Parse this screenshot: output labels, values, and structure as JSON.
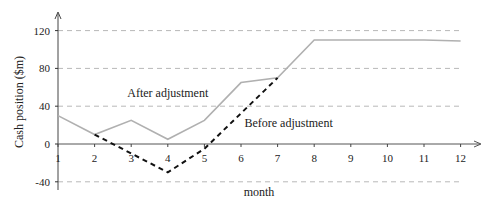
{
  "chart_data": {
    "type": "line",
    "title": "",
    "xlabel": "month",
    "ylabel": "Cash position ($m)",
    "x": [
      1,
      2,
      3,
      4,
      5,
      6,
      7,
      8,
      9,
      10,
      11,
      12
    ],
    "xticks": [
      "1",
      "2",
      "3",
      "4",
      "5",
      "6",
      "7",
      "8",
      "9",
      "10",
      "11",
      "12"
    ],
    "yticks": [
      "120",
      "80",
      "40",
      "0",
      "-40"
    ],
    "ylim": [
      -40,
      130
    ],
    "grid": true,
    "series": [
      {
        "name": "After adjustment",
        "style": "solid",
        "color": "#b0b0b0",
        "points": [
          [
            1,
            30
          ],
          [
            2,
            10
          ],
          [
            3,
            25
          ],
          [
            4,
            5
          ],
          [
            5,
            25
          ],
          [
            6,
            65
          ],
          [
            7,
            70
          ],
          [
            8,
            110
          ],
          [
            9,
            110
          ],
          [
            10,
            110
          ],
          [
            11,
            110
          ],
          [
            12,
            109
          ]
        ]
      },
      {
        "name": "Before adjustment",
        "style": "dashed",
        "color": "#111111",
        "points": [
          [
            2,
            10
          ],
          [
            4,
            -30
          ],
          [
            5,
            -5
          ],
          [
            7,
            70
          ]
        ]
      }
    ],
    "annotations": [
      {
        "text": "After adjustment",
        "x": 4.0,
        "y": 50
      },
      {
        "text": "Before adjustment",
        "x": 7.3,
        "y": 18
      }
    ]
  }
}
